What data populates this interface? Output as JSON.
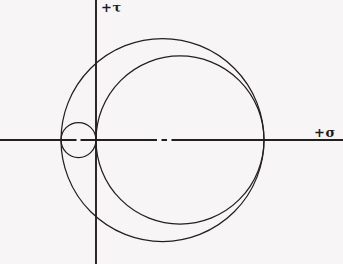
{
  "figure": {
    "background_color": "#f7f5f6",
    "line_color": "#231f20",
    "width": 343,
    "height": 264
  },
  "axes": {
    "origin": {
      "x": 96,
      "y": 140
    },
    "horizontal": {
      "name": "sigma-axis",
      "label": "+σ",
      "label_x": 314,
      "label_y": 126,
      "x1": 0,
      "y1": 140,
      "x2": 343,
      "y2": 140
    },
    "vertical": {
      "name": "tau-axis",
      "label": "+τ",
      "label_x": 101,
      "label_y": 1,
      "x1": 96,
      "y1": 0,
      "x2": 96,
      "y2": 264
    }
  },
  "chart_data": {
    "type": "scatter",
    "xlabel": "+σ",
    "ylabel": "+τ",
    "grid": false,
    "legend": null,
    "circles": [
      {
        "name": "small-circle",
        "cx": 78.5,
        "cy": 140,
        "r": 17.5,
        "left_x": 61,
        "right_x": 96,
        "description": "small circle left of the tau axis, tangent to the origin"
      },
      {
        "name": "large-inner-circle",
        "cx": 180,
        "cy": 140,
        "r": 84,
        "left_x": 96,
        "right_x": 264,
        "description": "large circle tangent to the tau axis at the origin"
      },
      {
        "name": "large-outer-circle",
        "cx": 162.5,
        "cy": 140,
        "r": 101.5,
        "left_x": 61,
        "right_x": 264,
        "description": "outermost circle spanning from the small circle left edge to the shared right intersection"
      }
    ],
    "center_marks": [
      {
        "name": "small-circle-center-mark",
        "x": 78.5,
        "y": 140
      },
      {
        "name": "large-circle-center-mark",
        "x": 165,
        "y": 140
      }
    ],
    "axis_intersections": [
      {
        "name": "left-point",
        "x": 61,
        "y": 140
      },
      {
        "name": "origin-point",
        "x": 96,
        "y": 140
      },
      {
        "name": "right-point",
        "x": 264,
        "y": 140
      }
    ]
  }
}
